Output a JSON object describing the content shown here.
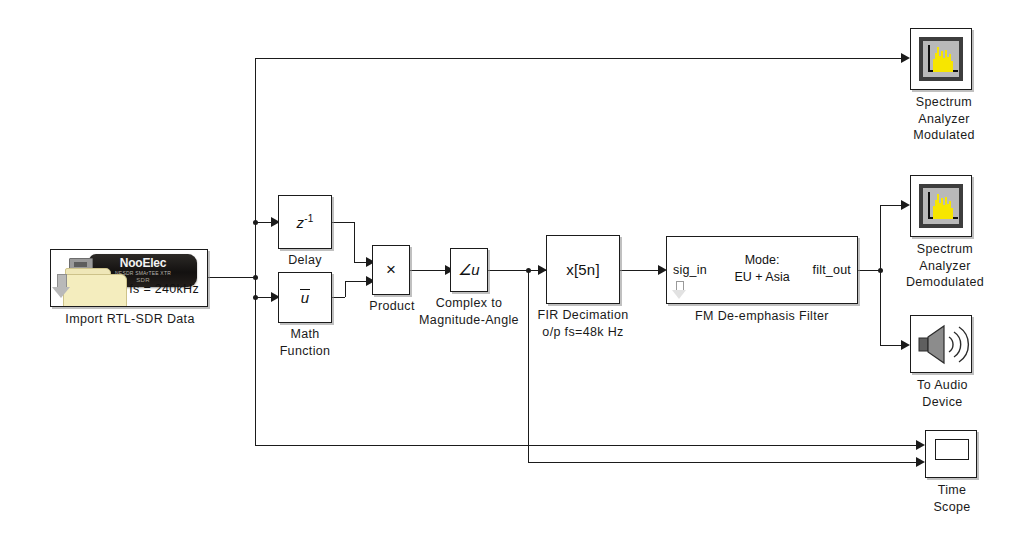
{
  "diagram": {
    "background_color": "#ffffff",
    "wire_color": "#1b1b1b"
  },
  "blocks": {
    "import_sdr": {
      "caption": "Import RTL-SDR Data",
      "fs_label": "fs = 240kHz",
      "dongle_brand": "NooElec",
      "dongle_sub": "NESDR SMArTEE XTR",
      "dongle_sub2": "SDR",
      "icon": "folder-down-arrow-icon"
    },
    "delay": {
      "caption": "Delay",
      "symbol_base": "z",
      "symbol_exp": "-1"
    },
    "math_function": {
      "caption": "Math\nFunction",
      "symbol": "u"
    },
    "product": {
      "caption": "Product",
      "symbol": "×"
    },
    "complex_to_mag_angle": {
      "caption": "Complex to\nMagnitude-Angle",
      "symbol": "∠u"
    },
    "fir_decimation": {
      "caption": "FIR Decimation\no/p fs=48k Hz",
      "symbol": "x[5n]"
    },
    "fm_deemphasis": {
      "caption": "FM De-emphasis Filter",
      "port_in": "sig_in",
      "port_out": "filt_out",
      "center_text": "Mode:\nEU + Asia",
      "icon": "subsystem-arrow-icon"
    },
    "spectrum_analyzer_modulated": {
      "caption": "Spectrum\nAnalyzer\nModulated",
      "icon": "spectrum-analyzer-icon",
      "icon_fill": "#f7e600",
      "icon_bg": "#b9b9b9",
      "icon_border": "#3d3d3d"
    },
    "spectrum_analyzer_demodulated": {
      "caption": "Spectrum\nAnalyzer\nDemodulated",
      "icon": "spectrum-analyzer-icon",
      "icon_fill": "#f7e600",
      "icon_bg": "#b9b9b9",
      "icon_border": "#3d3d3d"
    },
    "to_audio_device": {
      "caption": "To Audio\nDevice",
      "icon": "speaker-icon",
      "icon_fill": "#8c8c8c"
    },
    "time_scope": {
      "caption": "Time\nScope",
      "icon": "scope-screen-icon"
    }
  }
}
